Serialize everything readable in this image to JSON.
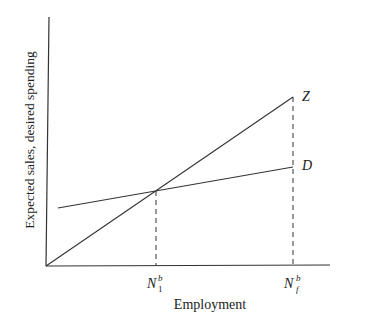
{
  "diagram": {
    "y_axis_label": "Expected sales, desired spending",
    "x_axis_label": "Employment",
    "lines": [
      {
        "name": "Z",
        "label": "Z",
        "from": [
          46,
          266
        ],
        "to": [
          293,
          97
        ]
      },
      {
        "name": "D",
        "label": "D",
        "from": [
          58,
          208
        ],
        "to": [
          293,
          167
        ]
      }
    ],
    "ticks": [
      {
        "base": "N",
        "sub": "1",
        "sup": "b",
        "x": 156
      },
      {
        "base": "N",
        "sub": "f",
        "sup": "b",
        "x": 293
      }
    ],
    "colors": {
      "line": "#333333",
      "background": "#ffffff"
    }
  }
}
